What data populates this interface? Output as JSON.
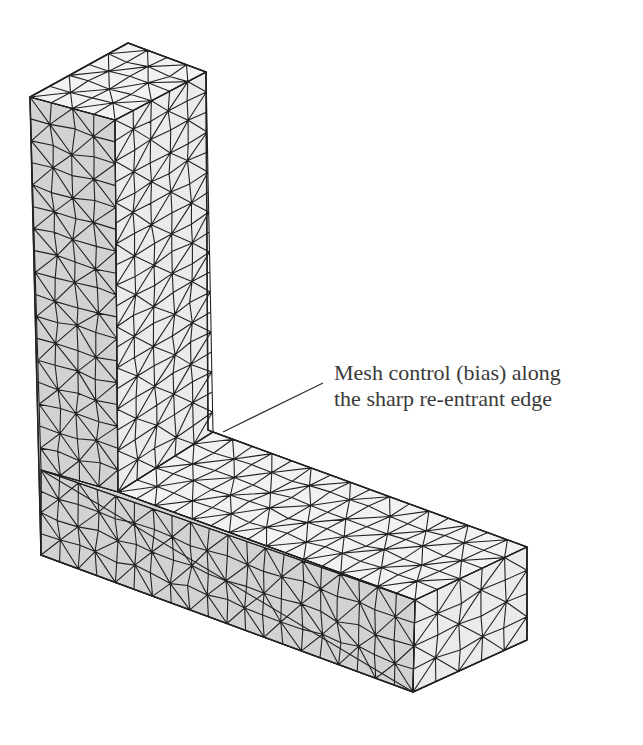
{
  "figure": {
    "colors": {
      "background": "#ffffff",
      "mesh_line": "#222222",
      "face_front": "#d2d2d2",
      "face_top": "#f2f2f2",
      "face_side": "#ebebeb",
      "text": "#3a3a3a"
    }
  },
  "annotation": {
    "line1": "Mesh control (bias) along",
    "line2": "the sharp re-entrant edge",
    "leader": {
      "x1": 223,
      "y1": 432,
      "x2": 323,
      "y2": 383
    }
  }
}
